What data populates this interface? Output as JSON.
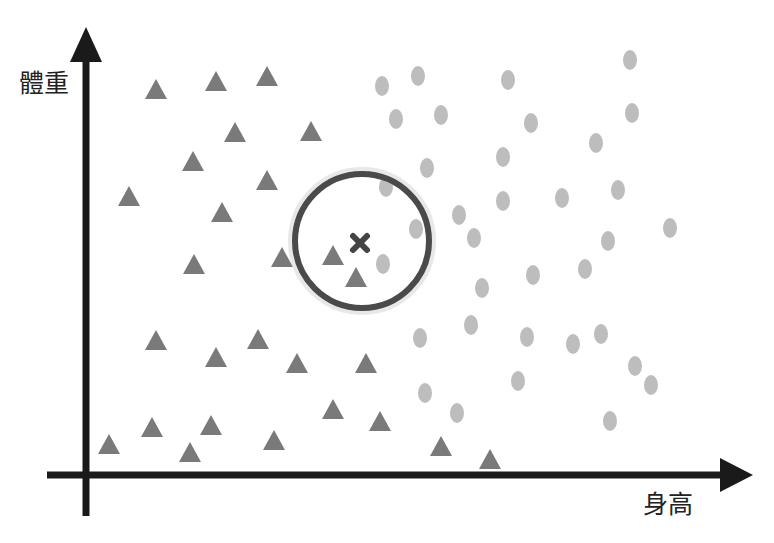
{
  "chart_data": {
    "type": "scatter",
    "title": "",
    "xlabel": "身高",
    "ylabel": "體重",
    "grid": false,
    "legend": null,
    "axes": {
      "x_axis": {
        "y": 475,
        "x_start": 47,
        "x_end": 722,
        "arrow_tip": 753
      },
      "y_axis": {
        "x": 86,
        "y_start": 516,
        "y_end": 60,
        "arrow_tip": 27
      }
    },
    "series": [
      {
        "name": "class-triangle",
        "marker": "triangle",
        "color": "#7a7a7a",
        "points": [
          [
            156,
            90
          ],
          [
            216,
            82
          ],
          [
            267,
            77
          ],
          [
            235,
            133
          ],
          [
            311,
            132
          ],
          [
            193,
            162
          ],
          [
            267,
            181
          ],
          [
            129,
            197
          ],
          [
            222,
            213
          ],
          [
            194,
            265
          ],
          [
            282,
            258
          ],
          [
            333,
            256
          ],
          [
            356,
            278
          ],
          [
            156,
            341
          ],
          [
            216,
            358
          ],
          [
            258,
            340
          ],
          [
            297,
            364
          ],
          [
            366,
            364
          ],
          [
            109,
            445
          ],
          [
            152,
            428
          ],
          [
            190,
            453
          ],
          [
            211,
            426
          ],
          [
            274,
            441
          ],
          [
            333,
            410
          ],
          [
            380,
            422
          ],
          [
            441,
            447
          ],
          [
            490,
            460
          ]
        ]
      },
      {
        "name": "class-circle",
        "marker": "ellipse",
        "color": "#bdbdbd",
        "points": [
          [
            382,
            86
          ],
          [
            418,
            76
          ],
          [
            508,
            80
          ],
          [
            630,
            60
          ],
          [
            396,
            119
          ],
          [
            441,
            115
          ],
          [
            531,
            123
          ],
          [
            632,
            113
          ],
          [
            596,
            143
          ],
          [
            427,
            168
          ],
          [
            503,
            157
          ],
          [
            386,
            187
          ],
          [
            618,
            190
          ],
          [
            562,
            198
          ],
          [
            503,
            201
          ],
          [
            459,
            215
          ],
          [
            416,
            229
          ],
          [
            474,
            238
          ],
          [
            383,
            264
          ],
          [
            608,
            241
          ],
          [
            670,
            228
          ],
          [
            533,
            275
          ],
          [
            585,
            269
          ],
          [
            482,
            288
          ],
          [
            420,
            338
          ],
          [
            471,
            325
          ],
          [
            527,
            337
          ],
          [
            573,
            344
          ],
          [
            601,
            334
          ],
          [
            635,
            366
          ],
          [
            651,
            385
          ],
          [
            518,
            381
          ],
          [
            425,
            393
          ],
          [
            457,
            413
          ],
          [
            610,
            421
          ]
        ]
      }
    ],
    "query_point": {
      "marker": "x",
      "x": 360,
      "y": 243,
      "color": "#444444"
    },
    "neighborhood_circle": {
      "cx": 362,
      "cy": 241,
      "r": 67,
      "stroke": "#4a4a4a",
      "stroke_width": 6
    }
  },
  "labels": {
    "y_axis": "體重",
    "x_axis": "身高"
  },
  "colors": {
    "axis": "#1a1a1a",
    "triangle": "#7a7a7a",
    "ellipse": "#bdbdbd",
    "query": "#444444",
    "circle": "#4a4a4a"
  }
}
